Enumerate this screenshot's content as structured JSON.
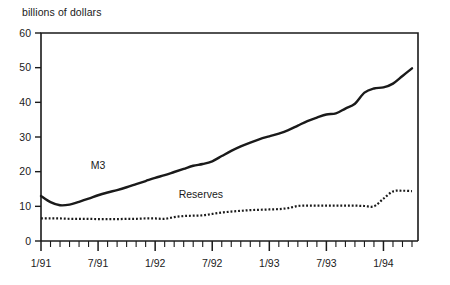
{
  "chart_data": {
    "type": "line",
    "title": "billions of dollars",
    "xlabel": "",
    "ylabel": "billions of dollars",
    "ylim": [
      0,
      60
    ],
    "yticks": [
      0,
      10,
      20,
      30,
      40,
      50,
      60
    ],
    "ytick_labels": [
      "0",
      "10",
      "20",
      "30",
      "40",
      "50",
      "60"
    ],
    "grid": false,
    "legend_position": "inline-annotation",
    "x_axis_note": "monthly ticks, labels every 6 months",
    "xtick_labels": [
      "1/91",
      "7/91",
      "1/92",
      "7/92",
      "1/93",
      "7/93",
      "1/94"
    ],
    "xtick_label_indices": [
      0,
      6,
      12,
      18,
      24,
      30,
      36
    ],
    "x_minor_count": 40,
    "x": [
      "1/91",
      "2/91",
      "3/91",
      "4/91",
      "5/91",
      "6/91",
      "7/91",
      "8/91",
      "9/91",
      "10/91",
      "11/91",
      "12/91",
      "1/92",
      "2/92",
      "3/92",
      "4/92",
      "5/92",
      "6/92",
      "7/92",
      "8/92",
      "9/92",
      "10/92",
      "11/92",
      "12/92",
      "1/93",
      "2/93",
      "3/93",
      "4/93",
      "5/93",
      "6/93",
      "7/93",
      "8/93",
      "9/93",
      "10/93",
      "11/93",
      "12/93",
      "1/94",
      "2/94",
      "3/94",
      "4/94"
    ],
    "series": [
      {
        "name": "M3",
        "style": "solid",
        "color": "#1a1a1a",
        "line_width": 2.4,
        "label_text": "M3",
        "values": [
          13.0,
          11.2,
          10.3,
          10.5,
          11.3,
          12.2,
          13.2,
          14.0,
          14.7,
          15.5,
          16.4,
          17.3,
          18.2,
          19.0,
          19.9,
          20.8,
          21.7,
          22.2,
          23.0,
          24.5,
          26.0,
          27.3,
          28.4,
          29.4,
          30.2,
          31.0,
          32.0,
          33.3,
          34.6,
          35.6,
          36.5,
          36.8,
          38.2,
          39.6,
          42.8,
          44.0,
          44.3,
          45.4,
          47.6,
          49.8
        ]
      },
      {
        "name": "Reserves",
        "style": "dotted",
        "color": "#1a1a1a",
        "line_width": 2.2,
        "label_text": "Reserves",
        "values": [
          6.5,
          6.5,
          6.5,
          6.4,
          6.4,
          6.4,
          6.3,
          6.3,
          6.3,
          6.4,
          6.4,
          6.5,
          6.5,
          6.4,
          6.9,
          7.2,
          7.3,
          7.4,
          7.8,
          8.2,
          8.5,
          8.7,
          8.9,
          9.0,
          9.1,
          9.2,
          9.5,
          10.1,
          10.2,
          10.2,
          10.2,
          10.2,
          10.2,
          10.2,
          10.1,
          10.0,
          12.2,
          14.3,
          14.5,
          14.4
        ]
      }
    ],
    "annotations": [
      {
        "name": "m3-label",
        "text": "M3",
        "x_value": 6.0,
        "y_value": 20.8
      },
      {
        "name": "reserves-label",
        "text": "Reserves",
        "x_value": 16.8,
        "y_value": 12.4
      }
    ]
  }
}
